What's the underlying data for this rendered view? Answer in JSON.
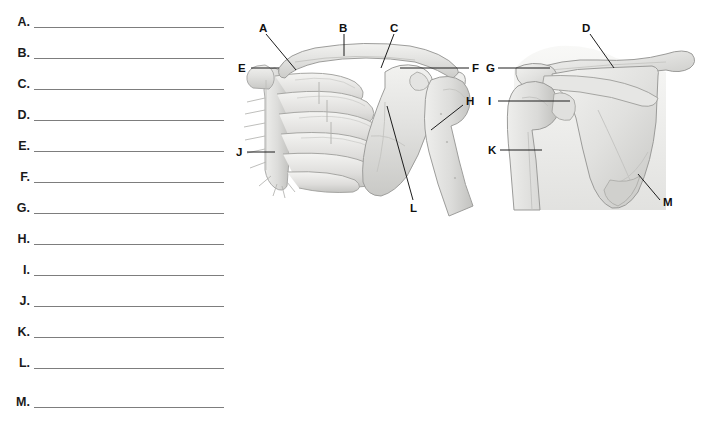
{
  "worksheet": {
    "answer_rows": [
      {
        "letter": "A."
      },
      {
        "letter": "B."
      },
      {
        "letter": "C."
      },
      {
        "letter": "D."
      },
      {
        "letter": "E."
      },
      {
        "letter": "F."
      },
      {
        "letter": "G."
      },
      {
        "letter": "H."
      },
      {
        "letter": "I."
      },
      {
        "letter": "J."
      },
      {
        "letter": "K."
      },
      {
        "letter": "L."
      },
      {
        "letter": "M."
      }
    ]
  },
  "figures": {
    "anterior": {
      "name": "anterior-shoulder-girdle-diagram",
      "labels": [
        {
          "id": "A",
          "text": "A"
        },
        {
          "id": "B",
          "text": "B"
        },
        {
          "id": "C",
          "text": "C"
        },
        {
          "id": "E",
          "text": "E"
        },
        {
          "id": "F",
          "text": "F"
        },
        {
          "id": "H",
          "text": "H"
        },
        {
          "id": "J",
          "text": "J"
        },
        {
          "id": "L",
          "text": "L"
        }
      ]
    },
    "posterior": {
      "name": "posterior-shoulder-diagram",
      "labels": [
        {
          "id": "D",
          "text": "D"
        },
        {
          "id": "G",
          "text": "G"
        },
        {
          "id": "I",
          "text": "I"
        },
        {
          "id": "K",
          "text": "K"
        },
        {
          "id": "M",
          "text": "M"
        }
      ]
    }
  },
  "colors": {
    "background": "#ffffff",
    "rule_line": "#7d7d7d",
    "label_text": "#101010",
    "leader_line": "#1d1d1d",
    "bone_fill": "#e8e8e6",
    "bone_stroke": "#9a9a98",
    "bone_shade": "#cfcfcd"
  }
}
